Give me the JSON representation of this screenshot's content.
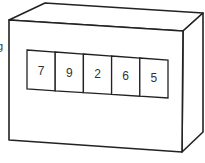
{
  "diagram": {
    "title": "",
    "edge_label": "g",
    "object": "rectangular box with counter display",
    "display": {
      "digits": [
        "7",
        "9",
        "2",
        "6",
        "5"
      ]
    },
    "colors": {
      "stroke": "#222222",
      "background": "#ffffff",
      "text": "#333333"
    }
  }
}
